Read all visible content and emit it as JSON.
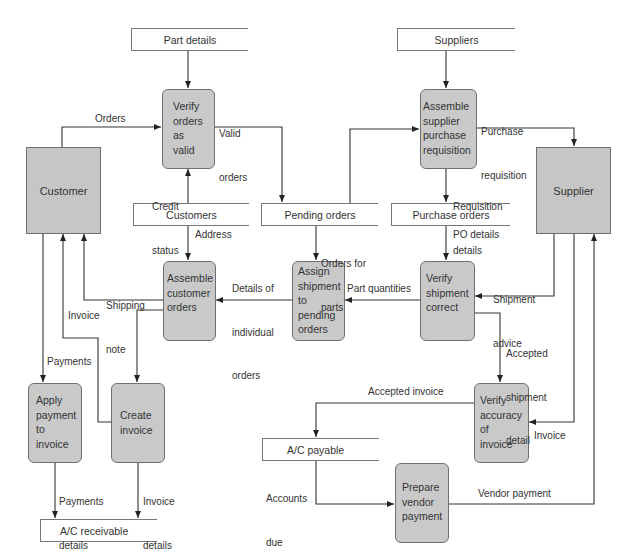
{
  "diagram": {
    "type": "data-flow-diagram",
    "colors": {
      "process_fill": "#c9c9c9",
      "entity_fill": "#c6c6c6",
      "stroke": "#333333",
      "background": "#ffffff"
    },
    "external_entities": {
      "customer": "Customer",
      "supplier": "Supplier"
    },
    "data_stores": {
      "part_details": "Part details",
      "suppliers": "Suppliers",
      "customers": "Customers",
      "pending_orders": "Pending orders",
      "purchase_orders": "Purchase orders",
      "ac_payable": "A/C payable",
      "ac_receivable": "A/C receivable"
    },
    "processes": {
      "verify_orders": [
        "Verify",
        "orders",
        "as",
        "valid"
      ],
      "assemble_pr": [
        "Assemble",
        "supplier",
        "purchase",
        "requisition"
      ],
      "assign_shipment": [
        "Assign",
        "shipment",
        "to",
        "pending",
        "orders"
      ],
      "assemble_customer_orders": [
        "Assemble",
        "customer",
        "orders"
      ],
      "verify_shipment": [
        "Verify",
        "shipment",
        "correct"
      ],
      "apply_payment": [
        "Apply",
        "payment",
        "to",
        "invoice"
      ],
      "create_invoice": [
        "Create",
        "invoice"
      ],
      "verify_invoice": [
        "Verify",
        "accuracy",
        "of",
        "invoice"
      ],
      "prepare_payment": [
        "Prepare",
        "vendor",
        "payment"
      ]
    },
    "flows": {
      "orders": "Orders",
      "valid_orders": [
        "Valid",
        "orders"
      ],
      "credit_status": [
        "Credit",
        "status"
      ],
      "purchase_requisition": [
        "Purchase",
        "requisition"
      ],
      "requisition_details": [
        "Requisition",
        "details"
      ],
      "address": "Address",
      "orders_for_parts": [
        "Orders for",
        "parts"
      ],
      "po_details": "PO details",
      "details_individual": [
        "Details of",
        "individual",
        "orders"
      ],
      "shipping_note": [
        "Shipping",
        "note"
      ],
      "part_quantities": "Part quantities",
      "shipment_advice": [
        "Shipment",
        "advice"
      ],
      "invoice_customer": "Invoice",
      "payments": "Payments",
      "accepted_shipment": [
        "Accepted",
        "shipment",
        "detail"
      ],
      "accepted_invoice": "Accepted invoice",
      "invoice_supplier": "Invoice",
      "payments_details": [
        "Payments",
        "details"
      ],
      "invoice_details": [
        "Invoice",
        "details"
      ],
      "accounts_due": [
        "Accounts",
        "due"
      ],
      "vendor_payment": "Vendor payment"
    }
  }
}
